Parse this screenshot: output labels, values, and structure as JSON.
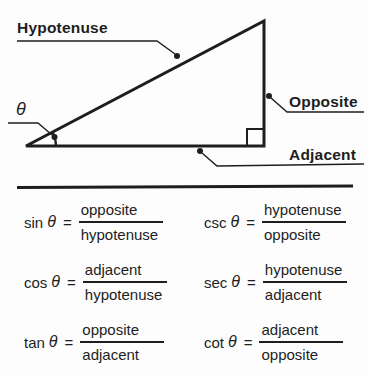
{
  "colors": {
    "ink": "#1e1e1e",
    "background": "#fdfdfd"
  },
  "figure": {
    "type": "right-triangle-diagram",
    "labels": {
      "hypotenuse": "Hypotenuse",
      "opposite": "Opposite",
      "adjacent": "Adjacent",
      "theta": "θ"
    }
  },
  "formulas": {
    "theta": "θ",
    "equals": "=",
    "items": [
      {
        "fn": "sin",
        "numerator": "opposite",
        "denominator": "hypotenuse"
      },
      {
        "fn": "csc",
        "numerator": "hypotenuse",
        "denominator": "opposite"
      },
      {
        "fn": "cos",
        "numerator": "adjacent",
        "denominator": "hypotenuse"
      },
      {
        "fn": "sec",
        "numerator": "hypotenuse",
        "denominator": "adjacent"
      },
      {
        "fn": "tan",
        "numerator": "opposite",
        "denominator": "adjacent"
      },
      {
        "fn": "cot",
        "numerator": "adjacent",
        "denominator": "opposite"
      }
    ]
  }
}
